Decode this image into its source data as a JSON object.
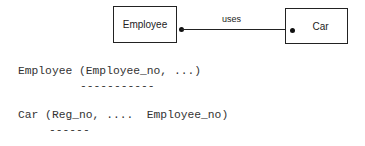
{
  "diagram": {
    "entities": [
      {
        "name": "Employee"
      },
      {
        "name": "Car"
      }
    ],
    "relationship": {
      "label": "uses",
      "from": "Employee",
      "to": "Car"
    }
  },
  "relations": [
    {
      "text": "Employee (Employee_no, ...)",
      "key_underline": "-----------",
      "key_note": "primary key: Employee_no"
    },
    {
      "text": "Car (Reg_no, ....  Employee_no)",
      "key_underline": "------",
      "key_note": "primary key: Reg_no"
    }
  ]
}
